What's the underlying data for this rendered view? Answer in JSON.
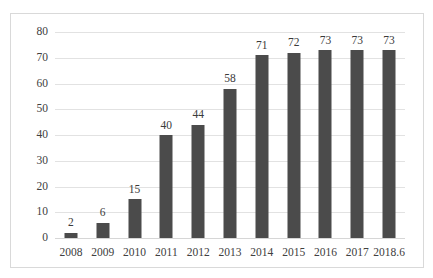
{
  "chart_data": {
    "type": "bar",
    "title": "",
    "subtitle": "",
    "xlabel": "",
    "ylabel": "",
    "categories": [
      "2008",
      "2009",
      "2010",
      "2011",
      "2012",
      "2013",
      "2014",
      "2015",
      "2016",
      "2017",
      "2018.6"
    ],
    "values": [
      2,
      6,
      15,
      40,
      44,
      58,
      71,
      72,
      73,
      73,
      73
    ],
    "data_labels": [
      "2",
      "6",
      "15",
      "40",
      "44",
      "58",
      "71",
      "72",
      "73",
      "73",
      "73"
    ],
    "ylim": [
      0,
      80
    ],
    "ytick_values": [
      0,
      10,
      20,
      30,
      40,
      50,
      60,
      70,
      80
    ],
    "ytick_labels": [
      "0",
      "10",
      "20",
      "30",
      "40",
      "50",
      "60",
      "70",
      "80"
    ],
    "grid": true,
    "grid_axis": "y",
    "legend": false,
    "legend_position": "none",
    "bar_color": "#4b4b4b",
    "grid_color": "#e2e2e2",
    "frame_color": "#d9d9d9",
    "text_color": "#404040",
    "background": "#ffffff"
  }
}
